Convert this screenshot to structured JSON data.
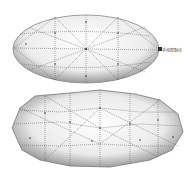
{
  "figure": {
    "top_mesh": {
      "name": "smooth-ellipsoid-mesh",
      "label": "手动控制点"
    },
    "bottom_mesh": {
      "name": "irregular-ellipsoid-mesh"
    }
  }
}
